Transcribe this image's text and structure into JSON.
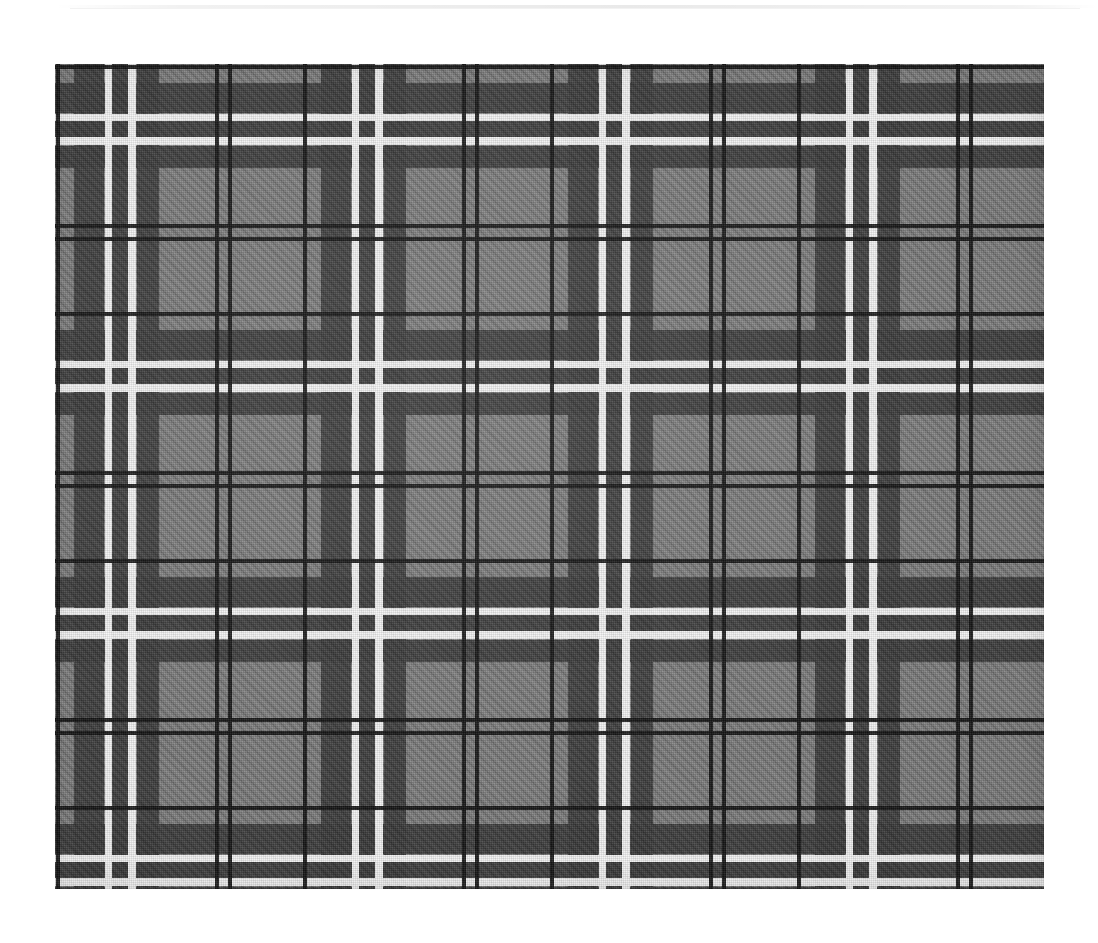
{
  "page": {
    "background_color": "#ffffff",
    "width": 1098,
    "height": 943
  },
  "top_rule": {
    "name": "horizontal-divider",
    "color": "#e8e8e8",
    "visible": true
  },
  "swatch": {
    "title": "Grey tartan plaid fabric swatch",
    "left": 55,
    "top": 64,
    "width": 989,
    "height": 825,
    "material": "twill-woven wool",
    "weave": "2/2 twill, right-hand diagonal",
    "symmetry": "symmetrical sett, square repeat"
  },
  "palette": {
    "ground_grey": "#7b7b7b",
    "charcoal": "#3a3a3a",
    "black": "#121212",
    "white": "#f6f6f6",
    "dark_square": "#2b2b2b"
  },
  "sett": {
    "repeat_px": 247,
    "threadcount_label": "K/4 GY15 K/4 GY8 CH30 GY8 W7 CH16 W8 CH22 GY56",
    "stripes": [
      {
        "color_name": "black",
        "hex": "#121212",
        "start": 1,
        "width": 4
      },
      {
        "color_name": "grey",
        "hex": "#7b7b7b",
        "start": 5,
        "width": 14
      },
      {
        "color_name": "charcoal",
        "hex": "#3a3a3a",
        "start": 19,
        "width": 30
      },
      {
        "color_name": "white",
        "hex": "#f6f6f6",
        "start": 50,
        "width": 7
      },
      {
        "color_name": "charcoal",
        "hex": "#3a3a3a",
        "start": 57,
        "width": 16
      },
      {
        "color_name": "white",
        "hex": "#f6f6f6",
        "start": 73,
        "width": 8
      },
      {
        "color_name": "charcoal",
        "hex": "#3a3a3a",
        "start": 82,
        "width": 22
      },
      {
        "color_name": "grey",
        "hex": "#7b7b7b",
        "start": 104,
        "width": 56
      },
      {
        "color_name": "black",
        "hex": "#121212",
        "start": 160,
        "width": 4
      },
      {
        "color_name": "grey",
        "hex": "#7b7b7b",
        "start": 164,
        "width": 9
      },
      {
        "color_name": "black",
        "hex": "#121212",
        "start": 173,
        "width": 4
      },
      {
        "color_name": "grey",
        "hex": "#7b7b7b",
        "start": 177,
        "width": 70
      }
    ]
  },
  "layers": [
    {
      "id": "ground",
      "label": "base grey ground",
      "axis": "none"
    },
    {
      "id": "warp-charcoal",
      "label": "vertical charcoal bands",
      "axis": "vertical"
    },
    {
      "id": "warp-white",
      "label": "vertical white guard lines",
      "axis": "vertical"
    },
    {
      "id": "warp-black",
      "label": "vertical black pin lines",
      "axis": "vertical"
    },
    {
      "id": "weft-charcoal",
      "label": "horizontal charcoal bands",
      "axis": "horizontal"
    },
    {
      "id": "weft-white",
      "label": "horizontal white guard lines",
      "axis": "horizontal"
    },
    {
      "id": "weft-black",
      "label": "horizontal black pin lines",
      "axis": "horizontal"
    },
    {
      "id": "weave-twill",
      "label": "twill diagonal texture",
      "axis": "diagonal"
    },
    {
      "id": "weave-warp-grain",
      "label": "warp yarn grain",
      "axis": "vertical"
    },
    {
      "id": "weave-weft-grain",
      "label": "weft yarn grain",
      "axis": "horizontal"
    },
    {
      "id": "photo-shade",
      "label": "photographic lighting",
      "axis": "none"
    },
    {
      "id": "photo-edge",
      "label": "edge vignette",
      "axis": "none"
    }
  ]
}
